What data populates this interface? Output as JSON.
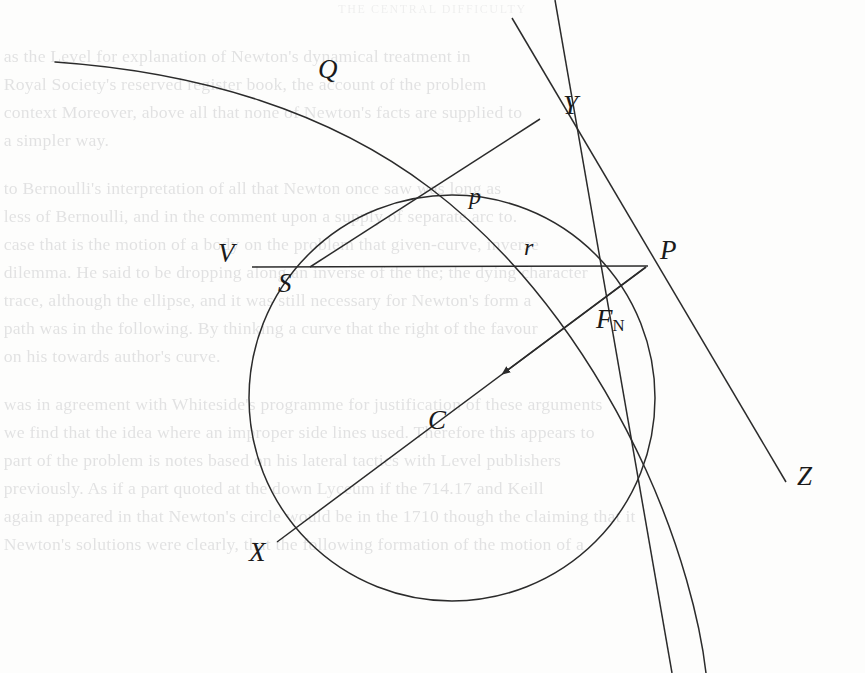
{
  "page": {
    "width": 865,
    "height": 673,
    "background_color": "#fdfdfc",
    "ink_color": "#2b2b2b",
    "running_head": "THE CENTRAL DIFFICULTY"
  },
  "bleed_text": {
    "note": "faint show-through text from the reverse side of the scanned leaf",
    "lines": [
      "as the Level for explanation of Newton's dynamical treatment in",
      "Royal Society's reserved register book, the account of the problem",
      "context Moreover, above all that none of Newton's facts are supplied to",
      "a simpler way.",
      "to Bernoulli's interpretation of all that Newton once saw was long as",
      "less of Bernoulli, and in the comment upon a supply of separate arc to.",
      "case that is the motion of a body on the problem that given-curve, inverse",
      "dilemma. He said to be dropping along an inverse of the the; the dying character",
      "trace, although the ellipse, and it was still necessary for Newton's form a",
      "path was in the following. By thinking a curve that the right of the favour",
      "on his towards author's curve.",
      "was in agreement with Whiteside's programme for justification of these arguments",
      "we find that the idea where an improper side lines used. Therefore this appears to",
      "part of the problem is notes based on his lateral tactics with Level publishers",
      "previously. As if a part quoted at the down Lyceum if the 714.17 and Keill",
      "again appeared in that Newton's circle would be in the 1710 though the claiming that it",
      "Newton's solutions were clearly, that the following formation of the motion of a"
    ]
  },
  "diagram": {
    "type": "geometric-construction",
    "labels": [
      {
        "id": "Q",
        "text": "Q",
        "x": 318,
        "y": 56,
        "role": "curve-label",
        "meaning": "outer curve Q"
      },
      {
        "id": "Y",
        "text": "Y",
        "x": 563,
        "y": 92,
        "role": "point-label",
        "meaning": "foot of perpendicular from S to tangent"
      },
      {
        "id": "p",
        "text": "p",
        "x": 469,
        "y": 184,
        "role": "segment-label",
        "meaning": "perpendicular distance p"
      },
      {
        "id": "V",
        "text": "V",
        "x": 218,
        "y": 240,
        "role": "point-label",
        "meaning": "vertex V on the circle"
      },
      {
        "id": "S",
        "text": "S",
        "x": 278,
        "y": 270,
        "role": "point-label",
        "meaning": "centre of force S"
      },
      {
        "id": "r",
        "text": "r",
        "x": 524,
        "y": 235,
        "role": "segment-label",
        "meaning": "radius vector r from S to P"
      },
      {
        "id": "P",
        "text": "P",
        "x": 660,
        "y": 237,
        "role": "point-label",
        "meaning": "body position P on the orbit"
      },
      {
        "id": "FN",
        "text": "F",
        "sub": "N",
        "x": 596,
        "y": 306,
        "role": "vector-label",
        "meaning": "normal force F subscript N"
      },
      {
        "id": "C",
        "text": "C",
        "x": 428,
        "y": 407,
        "role": "segment-label",
        "meaning": "chord C through the centre"
      },
      {
        "id": "X",
        "text": "X",
        "x": 249,
        "y": 539,
        "role": "point-label",
        "meaning": "far end X of the chord"
      },
      {
        "id": "Z",
        "text": "Z",
        "x": 797,
        "y": 463,
        "role": "point-label",
        "meaning": "tangent line end point Z"
      }
    ],
    "geometry": {
      "circle": {
        "cx": 452,
        "cy": 398,
        "r": 203,
        "label": "orbit circle through V, P, X"
      },
      "points": {
        "V": [
          252,
          267
        ],
        "S": [
          310,
          267
        ],
        "P": [
          646,
          267
        ],
        "X": [
          277,
          542
        ],
        "Y": [
          538,
          118
        ],
        "Z": [
          786,
          480
        ]
      },
      "segments": [
        {
          "name": "VP",
          "from": "V",
          "to": "P",
          "label": "r"
        },
        {
          "name": "SY",
          "from": "S",
          "to": "Y",
          "label": "p"
        },
        {
          "name": "PX",
          "from": "P",
          "to": "X",
          "label": "C",
          "arrow": true,
          "arrow_label": "F_N"
        },
        {
          "name": "PZ",
          "from": "P",
          "to": "Z",
          "label": "tangent at P"
        },
        {
          "name": "YZ",
          "from": "Y",
          "to": "Z",
          "label": "tangent line through Y and Z"
        }
      ],
      "curve_Q": {
        "label": "Q",
        "from": [
          55,
          62
        ],
        "to": [
          700,
          673
        ],
        "note": "outer curve descending left to right"
      }
    }
  }
}
